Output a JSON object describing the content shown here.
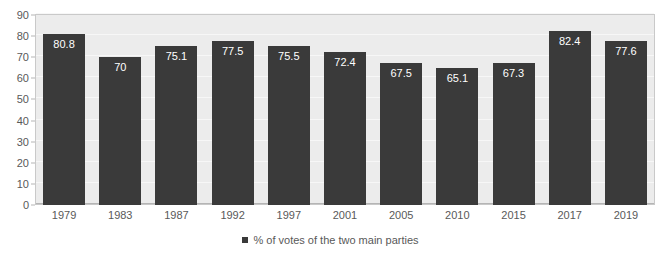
{
  "chart_data": {
    "type": "bar",
    "title": "",
    "subtitle": "",
    "xlabel": "",
    "ylabel": "",
    "categories": [
      "1979",
      "1983",
      "1987",
      "1992",
      "1997",
      "2001",
      "2005",
      "2010",
      "2015",
      "2017",
      "2019"
    ],
    "values": [
      80.8,
      70,
      75.1,
      77.5,
      75.5,
      72.4,
      67.5,
      65.1,
      67.3,
      82.4,
      77.6
    ],
    "value_labels": [
      "80.8",
      "70",
      "75.1",
      "77.5",
      "75.5",
      "72.4",
      "67.5",
      "65.1",
      "67.3",
      "82.4",
      "77.6"
    ],
    "series": [
      {
        "name": "% of votes of the two main parties",
        "values": [
          80.8,
          70,
          75.1,
          77.5,
          75.5,
          72.4,
          67.5,
          65.1,
          67.3,
          82.4,
          77.6
        ]
      }
    ],
    "ylim": [
      0,
      90
    ],
    "yticks": [
      0,
      10,
      20,
      30,
      40,
      50,
      60,
      70,
      80,
      90
    ],
    "ytick_labels": [
      "0",
      "10",
      "20",
      "30",
      "40",
      "50",
      "60",
      "70",
      "80",
      "90"
    ],
    "grid": true,
    "legend_position": "bottom",
    "legend": [
      "% of votes of the two main parties"
    ],
    "colors": {
      "bar": "#3a3a3a",
      "plot_background": "#ececec",
      "gridline": "#f7f7f7",
      "axis_line": "#b5b5b5",
      "plot_border": "#c9c9c9",
      "tick_label": "#595959",
      "value_label": "#ffffff",
      "page_background": "#ffffff"
    },
    "legend_marker_icon": "square-marker-icon"
  }
}
